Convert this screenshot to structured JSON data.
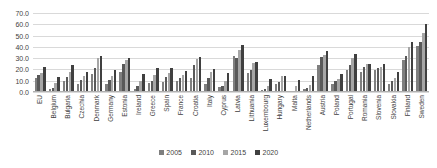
{
  "chart_data": {
    "type": "bar",
    "title": "",
    "subtitle": "",
    "xlabel": "",
    "ylabel": "",
    "ylim": [
      0,
      70
    ],
    "ytick_step": 10,
    "ytick_labels": [
      "0.0",
      "10.0",
      "20.0",
      "30.0",
      "40.0",
      "50.0",
      "60.0",
      "70.0"
    ],
    "grid": true,
    "legend_position": "bottom",
    "categories": [
      "EU",
      "Belgium",
      "Bulgaria",
      "Czechia",
      "Denmark",
      "Germany",
      "Estonia",
      "Ireland",
      "Greece",
      "Spain",
      "France",
      "Croatia",
      "Italy",
      "Cyprus",
      "Latvia",
      "Lithuania",
      "Luxembourg",
      "Hungary",
      "Malta",
      "Netherlands",
      "Austria",
      "Poland",
      "Portugal",
      "Romania",
      "Slovenia",
      "Slovakia",
      "Finland",
      "Sweden"
    ],
    "series": [
      {
        "name": "2005",
        "color": "#7f7f7f",
        "values": [
          12.5,
          2.8,
          9.5,
          7.5,
          16.0,
          6.8,
          17.8,
          3.0,
          7.8,
          8.8,
          9.5,
          12.0,
          7.5,
          4.5,
          31.5,
          16.8,
          1.8,
          6.8,
          0.5,
          3.0,
          24.0,
          6.8,
          19.5,
          17.5,
          19.8,
          6.8,
          28.8,
          40.5
        ]
      },
      {
        "name": "2010",
        "color": "#595959",
        "values": [
          15.5,
          3.2,
          13.5,
          10.5,
          21.5,
          11.0,
          24.5,
          5.2,
          9.8,
          13.2,
          12.5,
          23.5,
          12.5,
          5.5,
          30.5,
          19.5,
          2.8,
          8.5,
          1.0,
          3.8,
          31.0,
          9.5,
          24.0,
          22.5,
          21.0,
          9.5,
          32.0,
          44.0
        ]
      },
      {
        "name": "2015",
        "color": "#a6a6a6",
        "values": [
          16.5,
          8.0,
          18.0,
          14.5,
          30.5,
          14.5,
          28.8,
          9.8,
          15.5,
          16.5,
          15.0,
          29.0,
          17.5,
          9.5,
          37.5,
          25.5,
          5.0,
          14.5,
          5.0,
          5.8,
          32.8,
          11.8,
          30.5,
          24.5,
          22.0,
          12.8,
          39.5,
          52.5
        ]
      },
      {
        "name": "2020",
        "color": "#404040",
        "values": [
          22.0,
          13.0,
          23.5,
          17.3,
          31.5,
          19.5,
          30.0,
          16.0,
          21.5,
          21.0,
          19.0,
          31.0,
          20.5,
          16.8,
          42.0,
          26.8,
          11.5,
          13.8,
          10.7,
          14.0,
          36.5,
          16.2,
          34.0,
          24.5,
          25.0,
          17.5,
          44.0,
          60.0
        ]
      }
    ]
  }
}
